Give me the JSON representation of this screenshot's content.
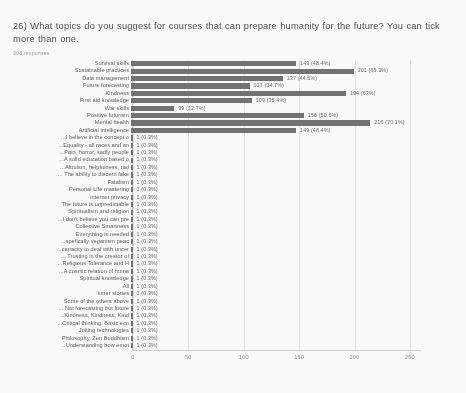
{
  "header": {
    "question": "26) What topics do you suggest for courses that can prepare humanity for the future? You can tick more than one.",
    "responses": "308 responses"
  },
  "chart_data": {
    "type": "bar",
    "orientation": "horizontal",
    "title": "26) What topics do you suggest for courses that can prepare humanity for the future? You can tick more than one.",
    "subtitle": "308 responses",
    "xlabel": "",
    "ylabel": "",
    "xlim": [
      0,
      260
    ],
    "xticks": [
      0,
      50,
      100,
      150,
      200,
      250
    ],
    "xtick_labels": [
      "0",
      "50",
      "100",
      "150",
      "200",
      "250"
    ],
    "grid": true,
    "legend": false,
    "total_responses": 308,
    "bar_color": "#6f6f6f",
    "categories": [
      "Survival skills",
      "Sustainable practices",
      "Data management",
      "Future forecasting",
      "Kindness",
      "First aid knowledge",
      "War skills",
      "Positive futurism",
      "Mental health",
      "Artificial intelligence",
      "I believe in the concept o...",
      "Equality - all races and an...",
      "Pain, horror, sadly people...",
      "A solid education based o...",
      "Altruism, helpfulness, rad...",
      "The ability to discern fake ...",
      "Fatalism",
      "Personal Life mastering",
      "internet privacy",
      "The future is unpredictable",
      "Spiritualism and religion",
      "I don't believe you can pre...",
      "Collective Smartness",
      "Everything is needed",
      "spefically veganism peac...",
      "capacity to deal with uncer...",
      "Trusting in the creator of ...",
      "Religious Tolerance and H...",
      "A cosmic relation of huma...",
      "Spiritual knowledge",
      "All",
      "inner stories",
      "Some of the others above",
      "Not forecasting but future ...",
      "Kindness, Kindness, Kind...",
      "Critical thinking. Basic eco...",
      "Jolting technologies",
      "Philosophy, Zen Buddhism",
      "Understanding how emot..."
    ],
    "values": [
      149,
      201,
      137,
      107,
      194,
      109,
      39,
      156,
      216,
      149,
      1,
      1,
      1,
      1,
      1,
      1,
      1,
      1,
      1,
      1,
      1,
      1,
      1,
      1,
      1,
      1,
      1,
      1,
      1,
      1,
      1,
      1,
      1,
      1,
      1,
      1,
      1,
      1,
      1
    ],
    "value_labels": [
      "149 (48.4%)",
      "201 (65.3%)",
      "137 (44.5%)",
      "107 (34.7%)",
      "194 (63%)",
      "109 (35.4%)",
      "39 (12.7%)",
      "156 (50.6%)",
      "216 (70.1%)",
      "149 (48.4%)",
      "1 (0.3%)",
      "1 (0.3%)",
      "1 (0.3%)",
      "1 (0.3%)",
      "1 (0.3%)",
      "1 (0.3%)",
      "1 (0.3%)",
      "1 (0.3%)",
      "1 (0.3%)",
      "1 (0.3%)",
      "1 (0.3%)",
      "1 (0.3%)",
      "1 (0.3%)",
      "1 (0.3%)",
      "1 (0.3%)",
      "1 (0.3%)",
      "1 (0.3%)",
      "1 (0.3%)",
      "1 (0.3%)",
      "1 (0.3%)",
      "1 (0.3%)",
      "1 (0.3%)",
      "1 (0.3%)",
      "1 (0.3%)",
      "1 (0.3%)",
      "1 (0.3%)",
      "1 (0.3%)",
      "1 (0.3%)",
      "1 (0.3%)"
    ]
  }
}
